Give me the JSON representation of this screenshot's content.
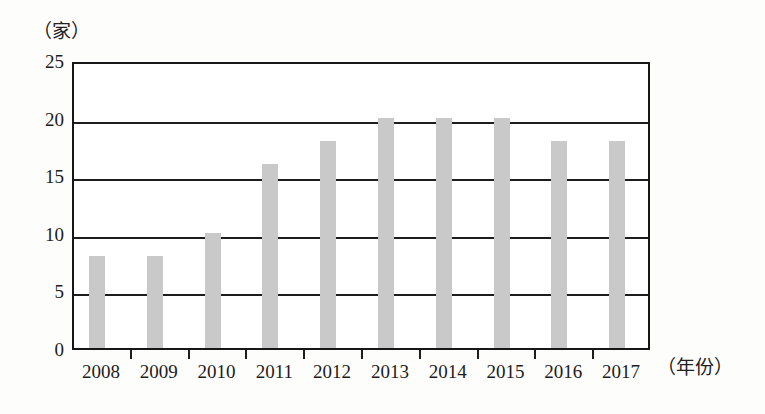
{
  "chart_data": {
    "type": "bar",
    "title": "",
    "subtitle": "",
    "xlabel": "（年份）",
    "ylabel": "（家）",
    "categories": [
      "2008",
      "2009",
      "2010",
      "2011",
      "2012",
      "2013",
      "2014",
      "2015",
      "2016",
      "2017"
    ],
    "values": [
      8,
      8,
      10,
      16,
      18,
      20,
      20,
      20,
      18,
      18
    ],
    "series": [
      {
        "name": "",
        "values": [
          8,
          8,
          10,
          16,
          18,
          20,
          20,
          20,
          18,
          18
        ]
      }
    ],
    "ylim": [
      0,
      25
    ],
    "y_ticks": [
      "0",
      "5",
      "10",
      "15",
      "20",
      "25"
    ],
    "y_tick_values": [
      0,
      5,
      10,
      15,
      20,
      25
    ],
    "grid": "horizontal",
    "legend": "none",
    "bar_color": "#c9c9c9",
    "axis_color": "#1d1d1d",
    "background_color": "#ffffff"
  },
  "axes": {
    "y_unit_label": "（家）",
    "x_unit_label": "（年份）"
  }
}
